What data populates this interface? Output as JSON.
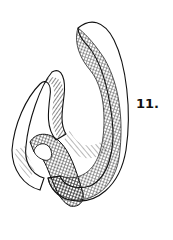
{
  "figure": {
    "label": "11.",
    "ink_color": "#111111",
    "paper_color": "#ffffff"
  }
}
